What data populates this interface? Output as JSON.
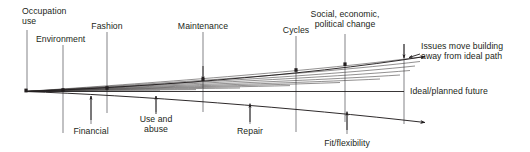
{
  "figure": {
    "type": "fan-divergence-diagram",
    "width": 530,
    "height": 152,
    "line_color": "#231f20",
    "background_color": "#ffffff"
  },
  "geometry": {
    "origin": {
      "x": 25,
      "y": 91.5
    },
    "fan_bundle": {
      "count": 11,
      "left_x": 25,
      "right_x": 196,
      "left_y_top": 84.5,
      "left_y_bottom": 93.5,
      "note": "tightly stacked near-horizontal lines fanning from origin"
    },
    "ideal_line": {
      "x1": 25,
      "y1": 91.5,
      "x2": 404,
      "y2": 91.5
    },
    "upper_path": {
      "start": [
        25,
        91.5
      ],
      "control": [
        250,
        86
      ],
      "end": [
        425,
        56
      ]
    },
    "lower_path": {
      "start": [
        25,
        91.5
      ],
      "control": [
        250,
        100
      ],
      "end": [
        425,
        122
      ]
    }
  },
  "labels_above": [
    {
      "name": "occupation-use",
      "text": "Occupation\nuse",
      "tick_x": 27,
      "text_x": 22,
      "text_y": 6,
      "align": "left",
      "tick_top": 30,
      "tick_bottom": 92
    },
    {
      "name": "environment",
      "text": "Environment",
      "tick_x": 63,
      "text_x": 36,
      "text_y": 34,
      "align": "left",
      "tick_top": 45,
      "tick_bottom": 133
    },
    {
      "name": "fashion",
      "text": "Fashion",
      "tick_x": 107,
      "text_x": 107,
      "text_y": 21,
      "align": "center",
      "tick_top": 32,
      "tick_bottom": 113
    },
    {
      "name": "maintenance",
      "text": "Maintenance",
      "tick_x": 203,
      "text_x": 203,
      "text_y": 21,
      "align": "center",
      "tick_top": 32,
      "tick_bottom": 112
    },
    {
      "name": "cycles",
      "text": "Cycles",
      "tick_x": 296,
      "text_x": 296,
      "text_y": 25,
      "align": "center",
      "tick_top": 36,
      "tick_bottom": 132
    },
    {
      "name": "social-economic-political-change",
      "text": "Social, economic,\npolitical change",
      "tick_x": 345,
      "text_x": 345,
      "text_y": 9,
      "align": "center",
      "tick_top": 34,
      "tick_bottom": 122
    }
  ],
  "labels_below": [
    {
      "name": "financial",
      "text": "Financial",
      "tick_x": 91,
      "text_x": 91,
      "text_y": 126,
      "align": "center",
      "arrow_from_y": 120,
      "arrow_to_y": 97
    },
    {
      "name": "use-and-abuse",
      "text": "Use and\nabuse",
      "tick_x": 156,
      "text_x": 156,
      "text_y": 114,
      "align": "center",
      "arrow_from_y": 114,
      "arrow_to_y": 97
    },
    {
      "name": "repair",
      "text": "Repair",
      "tick_x": 250,
      "text_x": 250,
      "text_y": 126,
      "align": "center",
      "arrow_from_y": 120,
      "arrow_to_y": 104
    },
    {
      "name": "fit-flexibility",
      "text": "Fit/flexibility",
      "tick_x": 347,
      "text_x": 347,
      "text_y": 138,
      "align": "center",
      "arrow_from_y": 130,
      "arrow_to_y": 112
    }
  ],
  "annotations": {
    "issues_move": {
      "name": "issues-move-building-annotation",
      "line1": "Issues move building",
      "line2": "away from ideal path",
      "text_x": 421,
      "text_y": 41
    },
    "ideal_future": {
      "name": "ideal-planned-future-annotation",
      "text": "Ideal/planned future",
      "text_x": 410,
      "text_y": 86
    }
  },
  "markers": {
    "note": "small square nodes where tick lines cross the upper deflected path",
    "points": [
      {
        "x": 27,
        "y": 91
      },
      {
        "x": 63,
        "y": 90
      },
      {
        "x": 107,
        "y": 88
      },
      {
        "x": 203,
        "y": 79
      },
      {
        "x": 296,
        "y": 70
      },
      {
        "x": 345,
        "y": 64
      }
    ]
  }
}
